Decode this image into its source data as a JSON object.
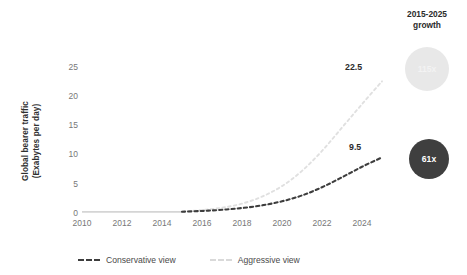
{
  "chart_data": {
    "type": "line",
    "title": "",
    "xlabel": "",
    "ylabel": "Global bearer traffic (Exabytes per day)",
    "ylabel_line1": "Global bearer traffic",
    "ylabel_line2": "(Exabytes per day)",
    "xlim": [
      2010,
      2025
    ],
    "ylim": [
      0,
      27
    ],
    "grid": false,
    "legend_position": "bottom-left",
    "xticks": [
      "2010",
      "2012",
      "2014",
      "2016",
      "2018",
      "2020",
      "2022",
      "2024"
    ],
    "xtick_values": [
      2010,
      2012,
      2014,
      2016,
      2018,
      2020,
      2022,
      2024
    ],
    "yticks": [
      "0",
      "5",
      "10",
      "15",
      "20",
      "25"
    ],
    "ytick_values": [
      0,
      5,
      10,
      15,
      20,
      25
    ],
    "x": [
      2010,
      2011,
      2012,
      2013,
      2014,
      2015,
      2016,
      2017,
      2018,
      2019,
      2020,
      2021,
      2022,
      2023,
      2024,
      2025
    ],
    "series": [
      {
        "name": "Conservative view",
        "color": "#3d3d3d",
        "style": "dashed",
        "end_label": "9.5",
        "values": [
          0.15,
          0.16,
          0.17,
          0.18,
          0.2,
          0.22,
          0.35,
          0.55,
          0.85,
          1.3,
          2.0,
          3.0,
          4.4,
          6.1,
          7.9,
          9.5
        ]
      },
      {
        "name": "Aggressive view",
        "color": "#e0e0e0",
        "style": "dashed",
        "end_label": "22.5",
        "values": [
          0.15,
          0.16,
          0.17,
          0.18,
          0.2,
          0.22,
          0.5,
          0.9,
          1.6,
          2.8,
          4.6,
          7.2,
          10.6,
          14.6,
          18.6,
          22.5
        ]
      }
    ],
    "baseline": {
      "name": "historical-baseline",
      "color": "#d5d5d5",
      "style": "solid",
      "x_start": 2010,
      "x_end": 2015,
      "value": 0.2
    },
    "annotations": {
      "growth_title_line1": "2015-2025",
      "growth_title_line2": "growth",
      "bubbles": [
        {
          "name": "aggressive-growth-bubble",
          "label": "115x",
          "color": "#e8e8e8",
          "text_color": "#f3f3f3"
        },
        {
          "name": "conservative-growth-bubble",
          "label": "61x",
          "color": "#3f3f3f",
          "text_color": "#ffffff"
        }
      ]
    }
  },
  "colors": {
    "conservative": "#3d3d3d",
    "aggressive": "#e0e0e0",
    "baseline": "#d5d5d5",
    "bubble_light": "#e8e8e8",
    "bubble_dark": "#3f3f3f",
    "tick_text": "#777777",
    "body_text": "#2b2b2b",
    "background": "#ffffff"
  }
}
